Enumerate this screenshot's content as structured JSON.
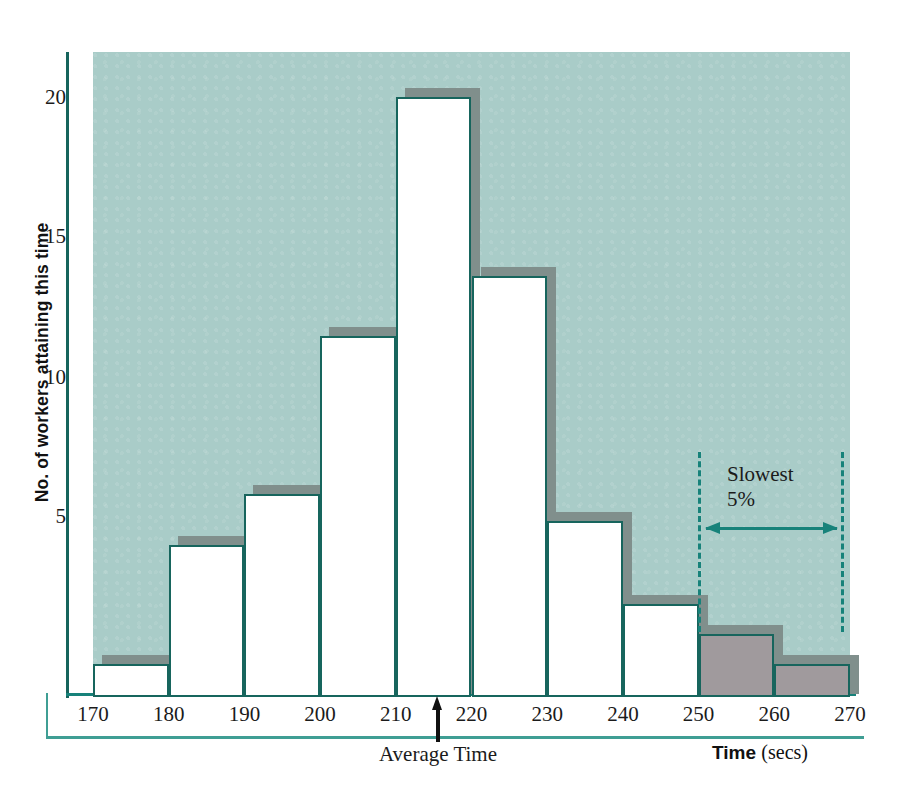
{
  "chart_data": {
    "type": "bar",
    "title": "",
    "subtitle": "",
    "xlabel_bold": "Time",
    "xlabel_unit": "(secs)",
    "ylabel": "No. of workers attaining this time",
    "categories": [
      "170-180",
      "180-190",
      "190-200",
      "200-210",
      "210-220",
      "220-230",
      "230-240",
      "240-250",
      "250-260",
      "260-270"
    ],
    "bin_edges": [
      170,
      180,
      190,
      200,
      210,
      220,
      230,
      240,
      250,
      260,
      270
    ],
    "values": [
      1,
      5,
      6.7,
      12,
      20,
      14,
      5.8,
      3,
      2,
      1
    ],
    "bar_styles": [
      "open",
      "open",
      "open",
      "open",
      "open",
      "open",
      "open",
      "open",
      "shaded",
      "shaded"
    ],
    "xlim": [
      170,
      270
    ],
    "ylim": [
      0,
      21.5
    ],
    "xticks": [
      "170",
      "180",
      "190",
      "200",
      "210",
      "220",
      "230",
      "240",
      "250",
      "260",
      "270"
    ],
    "yticks": [
      "5",
      "10",
      "15",
      "20"
    ],
    "ytick_values": [
      5,
      10,
      15,
      20
    ],
    "grid": false,
    "legend": "none",
    "annotations": [
      {
        "name": "average-time",
        "label": "Average Time",
        "x_value": 215,
        "marker": "up-arrow"
      },
      {
        "name": "slowest-five-percent",
        "line1": "Slowest",
        "line2": "5%",
        "x_from": 250,
        "x_to": 270,
        "marker": "double-headed-arrow"
      }
    ],
    "colors": {
      "plot_background": "#a9ccc8",
      "bar_outline": "#17655d",
      "bar_fill": "#ffffff",
      "bar_shaded_fill": "#a09a9d",
      "bar_shadow": "#808f8c",
      "axis": "#16645c",
      "axis_secondary": "#3f9e94",
      "annotation": "#17827a",
      "text": "#1b1b1b"
    }
  }
}
